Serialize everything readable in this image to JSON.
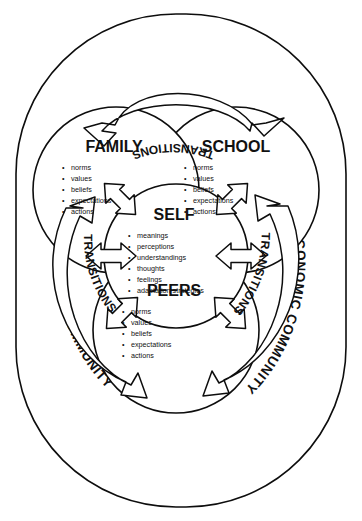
{
  "figure": {
    "outer_ring_label": "LARGER SOCIOECONOMIC COMMUNITY",
    "transitions_label": "TRANSITIONS",
    "orientation": "rotated-90-clockwise",
    "edge_caption": ""
  },
  "colors": {
    "ink": "#0d0d0d",
    "paper": "#ffffff"
  },
  "nodes": {
    "self": {
      "title": "SELF",
      "items": [
        "meanings",
        "perceptions",
        "understandings",
        "thoughts",
        "feelings",
        "adaptation strategies"
      ]
    },
    "school": {
      "title": "SCHOOL",
      "items": [
        "norms",
        "values",
        "beliefs",
        "expectations",
        "actions"
      ]
    },
    "family": {
      "title": "FAMILY",
      "items": [
        "norms",
        "values",
        "beliefs",
        "expectations",
        "actions"
      ]
    },
    "peers": {
      "title": "PEERS",
      "items": [
        "norms",
        "values",
        "beliefs",
        "expectations",
        "actions"
      ]
    }
  },
  "ring_labels": [
    {
      "id": "ring-top",
      "text": "LARGER SOCIOECONOMIC COMMUNITY"
    },
    {
      "id": "ring-bottom",
      "text": "LARGER SOCIOECONOMIC COMMUNITY"
    }
  ],
  "transition_arrows": [
    {
      "id": "transitions-school-family",
      "text": "TRANSITIONS"
    },
    {
      "id": "transitions-school-peers",
      "text": "TRANSITIONS"
    },
    {
      "id": "transitions-family-peers",
      "text": "TRANSITIONS"
    }
  ]
}
